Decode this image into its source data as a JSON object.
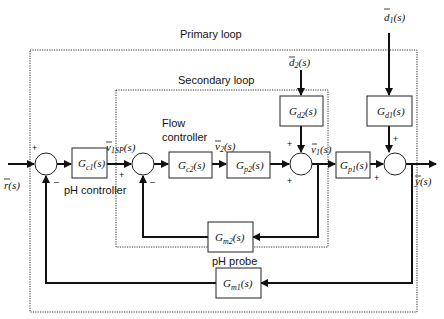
{
  "diagram": {
    "type": "cascade-control-block-diagram",
    "loops": {
      "primary": {
        "label": "Primary loop"
      },
      "secondary": {
        "label": "Secondary loop"
      }
    },
    "annotations": {
      "ph_controller": "pH controller",
      "flow_controller_line1": "Flow",
      "flow_controller_line2": "controller",
      "ph_probe": "pH probe"
    },
    "signals": {
      "r": {
        "main": "r",
        "arg": "(s)"
      },
      "v1sp": {
        "main": "v",
        "sub": "1SP",
        "arg": "(s)"
      },
      "v2": {
        "main": "v",
        "sub": "2",
        "arg": "(s)"
      },
      "v1": {
        "main": "v",
        "sub": "1",
        "arg": "(s)"
      },
      "y": {
        "main": "y",
        "arg": "(s)"
      },
      "d1": {
        "main": "d",
        "sub": "1",
        "arg": "(s)"
      },
      "d2": {
        "main": "d",
        "sub": "2",
        "arg": "(s)"
      }
    },
    "blocks": {
      "gc1": {
        "main": "G",
        "sub": "c1",
        "arg": "(s)"
      },
      "gc2": {
        "main": "G",
        "sub": "c2",
        "arg": "(s)"
      },
      "gp2": {
        "main": "G",
        "sub": "p2",
        "arg": "(s)"
      },
      "gp1": {
        "main": "G",
        "sub": "p1",
        "arg": "(s)"
      },
      "gd2": {
        "main": "G",
        "sub": "d2",
        "arg": "(s)"
      },
      "gd1": {
        "main": "G",
        "sub": "d1",
        "arg": "(s)"
      },
      "gm2": {
        "main": "G",
        "sub": "m2",
        "arg": "(s)"
      },
      "gm1": {
        "main": "G",
        "sub": "m1",
        "arg": "(s)"
      }
    },
    "signs": {
      "plus": "+",
      "minus": "–"
    },
    "edges": [
      [
        "r",
        "sum1",
        "+"
      ],
      [
        "gm1",
        "sum1",
        "-"
      ],
      [
        "sum1",
        "gc1"
      ],
      [
        "gc1",
        "sum2",
        "+"
      ],
      [
        "gm2",
        "sum2",
        "-"
      ],
      [
        "sum2",
        "gc2"
      ],
      [
        "gc2",
        "gp2"
      ],
      [
        "gp2",
        "sum3",
        "+"
      ],
      [
        "d2",
        "gd2"
      ],
      [
        "gd2",
        "sum3",
        "+"
      ],
      [
        "sum3",
        "gp1"
      ],
      [
        "sum3",
        "gm2"
      ],
      [
        "gp1",
        "sum4",
        "+"
      ],
      [
        "d1",
        "gd1"
      ],
      [
        "gd1",
        "sum4",
        "+"
      ],
      [
        "sum4",
        "y"
      ],
      [
        "sum4",
        "gm1"
      ]
    ]
  }
}
